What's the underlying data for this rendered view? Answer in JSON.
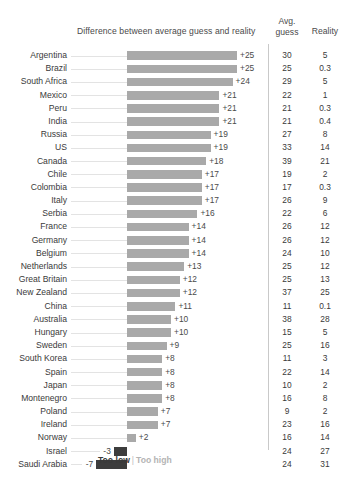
{
  "header": {
    "chart_title": "Difference between average guess and reality",
    "col_guess_line1": "Avg.",
    "col_guess_line2": "guess",
    "col_reality": "Reality"
  },
  "legend": {
    "too_low": "Too low",
    "separator": "|",
    "too_high": "Too high"
  },
  "colors": {
    "bar_positive": "#a9a9a9",
    "bar_negative": "#3d3d3d",
    "divider": "#c9c9c9",
    "leader_line": "#e3e3e3",
    "text": "#3a3a3a",
    "legend_high": "#b4b4b4"
  },
  "chart_data": {
    "type": "bar",
    "title": "Difference between average guess and reality",
    "xlabel": "",
    "ylabel": "",
    "orientation": "horizontal",
    "grid": false,
    "legend_position": "bottom",
    "xlim": [
      -7,
      25
    ],
    "zero_baseline_px": 127,
    "px_per_unit": 4.4,
    "categories": [
      "Argentina",
      "Brazil",
      "South Africa",
      "Mexico",
      "Peru",
      "India",
      "Russia",
      "US",
      "Canada",
      "Chile",
      "Colombia",
      "Italy",
      "Serbia",
      "France",
      "Germany",
      "Belgium",
      "Netherlands",
      "Great Britain",
      "New Zealand",
      "China",
      "Australia",
      "Hungary",
      "Sweden",
      "South Korea",
      "Spain",
      "Japan",
      "Montenegro",
      "Poland",
      "Ireland",
      "Norway",
      "Israel",
      "Saudi Arabia"
    ],
    "values": [
      25,
      25,
      24,
      21,
      21,
      21,
      19,
      19,
      18,
      17,
      17,
      17,
      16,
      14,
      14,
      14,
      13,
      12,
      12,
      11,
      10,
      10,
      9,
      8,
      8,
      8,
      8,
      7,
      7,
      2,
      -3,
      -7
    ],
    "value_labels": [
      "+25",
      "+25",
      "+24",
      "+21",
      "+21",
      "+21",
      "+19",
      "+19",
      "+18",
      "+17",
      "+17",
      "+17",
      "+16",
      "+14",
      "+14",
      "+14",
      "+13",
      "+12",
      "+12",
      "+11",
      "+10",
      "+10",
      "+9",
      "+8",
      "+8",
      "+8",
      "+8",
      "+7",
      "+7",
      "+2",
      "-3",
      "-7"
    ],
    "series": [
      {
        "name": "Avg. guess",
        "values": [
          30,
          25,
          29,
          22,
          21,
          21,
          27,
          33,
          39,
          19,
          17,
          26,
          22,
          26,
          26,
          24,
          25,
          25,
          37,
          11,
          38,
          15,
          25,
          11,
          22,
          10,
          16,
          9,
          23,
          16,
          24,
          24
        ],
        "labels": [
          "30",
          "25",
          "29",
          "22",
          "21",
          "21",
          "27",
          "33",
          "39",
          "19",
          "17",
          "26",
          "22",
          "26",
          "26",
          "24",
          "25",
          "25",
          "37",
          "11",
          "38",
          "15",
          "25",
          "11",
          "22",
          "10",
          "16",
          "9",
          "23",
          "16",
          "24",
          "24"
        ]
      },
      {
        "name": "Reality",
        "values": [
          5,
          0.3,
          5,
          1,
          0.3,
          0.4,
          8,
          14,
          21,
          2,
          0.3,
          9,
          6,
          12,
          12,
          10,
          12,
          13,
          25,
          0.1,
          28,
          5,
          16,
          3,
          14,
          2,
          8,
          2,
          16,
          14,
          27,
          31
        ],
        "labels": [
          "5",
          "0.3",
          "5",
          "1",
          "0.3",
          "0.4",
          "8",
          "14",
          "21",
          "2",
          "0.3",
          "9",
          "6",
          "12",
          "12",
          "10",
          "12",
          "13",
          "25",
          "0.1",
          "28",
          "5",
          "16",
          "3",
          "14",
          "2",
          "8",
          "2",
          "16",
          "14",
          "27",
          "31"
        ]
      }
    ]
  }
}
